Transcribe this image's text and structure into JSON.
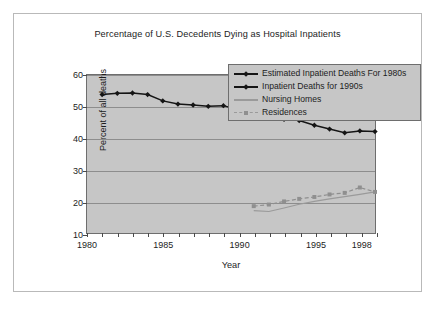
{
  "chart_data": {
    "type": "line",
    "title": "Percentage of U.S. Decedents Dying as Hospital Inpatients",
    "xlabel": "Year",
    "ylabel": "Percent of all deaths",
    "xlim": [
      1980,
      1999
    ],
    "ylim": [
      10,
      60
    ],
    "ytick_labels": [
      "10",
      "20",
      "30",
      "40",
      "50",
      "60"
    ],
    "ytick_values": [
      10,
      20,
      30,
      40,
      50,
      60
    ],
    "xtick_labels": [
      "1980",
      "1985",
      "1990",
      "1995",
      "1998"
    ],
    "xtick_values": [
      1980,
      1985,
      1990,
      1995,
      1998
    ],
    "grid": "horizontal",
    "legend_position": "top-right",
    "plot_background": "#c6c6c6",
    "series": [
      {
        "name": "Estimated Inpatient Deaths For 1980s",
        "color": "#151515",
        "marker": "diamond",
        "line_style": "solid",
        "x": [
          1981,
          1982,
          1983,
          1984,
          1985,
          1986,
          1987,
          1988,
          1989,
          1990
        ],
        "values": [
          53.8,
          54.2,
          54.3,
          53.8,
          51.8,
          50.8,
          50.5,
          50.1,
          50.3,
          49.0
        ]
      },
      {
        "name": "Inpatient Deaths for 1990s",
        "color": "#151515",
        "marker": "diamond",
        "line_style": "solid",
        "x": [
          1990,
          1991,
          1992,
          1993,
          1994,
          1995,
          1996,
          1997,
          1998,
          1999
        ],
        "values": [
          49.0,
          48.0,
          47.0,
          46.0,
          45.6,
          44.1,
          42.9,
          41.7,
          42.3,
          42.1
        ]
      },
      {
        "name": "Nursing Homes",
        "color": "#9a9a9a",
        "marker": "none",
        "line_style": "solid",
        "x": [
          1991,
          1992,
          1993,
          1994,
          1995,
          1996,
          1997,
          1998,
          1999
        ],
        "values": [
          17.1,
          16.8,
          17.9,
          19.1,
          20.0,
          20.8,
          21.5,
          22.2,
          23.0
        ]
      },
      {
        "name": "Residences",
        "color": "#8f8f8f",
        "marker": "square",
        "line_style": "dashed",
        "x": [
          1991,
          1992,
          1993,
          1994,
          1995,
          1996,
          1997,
          1998,
          1999
        ],
        "values": [
          18.5,
          19.0,
          20.0,
          20.8,
          21.4,
          22.2,
          22.7,
          24.4,
          23.0
        ]
      }
    ]
  },
  "legend": {
    "items": [
      {
        "label": "Estimated Inpatient Deaths For 1980s",
        "key": "diamond-dark-line"
      },
      {
        "label": "Inpatient Deaths for 1990s",
        "key": "diamond-dark-line"
      },
      {
        "label": "Nursing Homes",
        "key": "gray-solid-line"
      },
      {
        "label": "Residences",
        "key": "gray-dashed-square"
      }
    ]
  }
}
